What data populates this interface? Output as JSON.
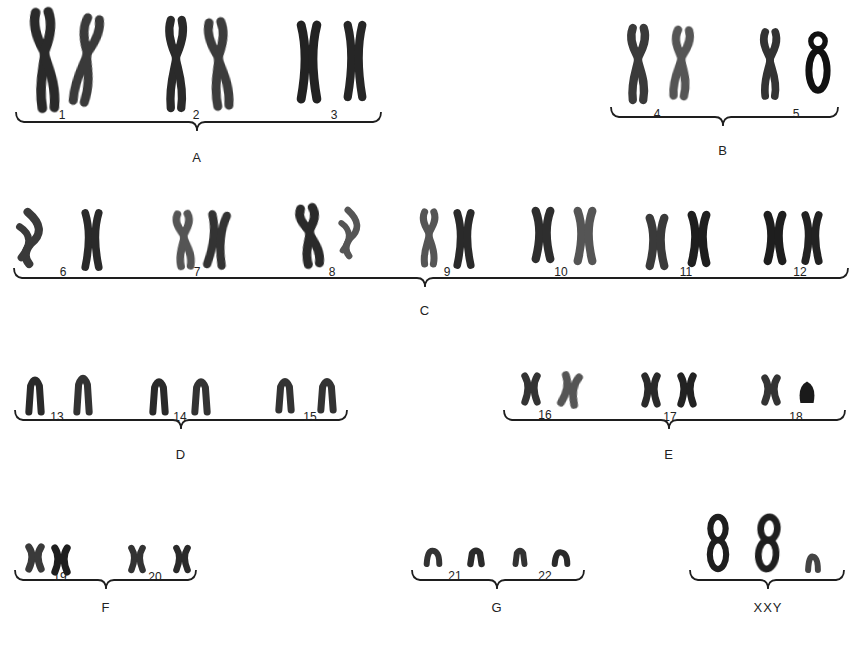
{
  "figure": {
    "ink_color": "#1e1e1e",
    "background": "#ffffff"
  },
  "groups": [
    {
      "label": "A",
      "label_x": 197,
      "label_y": 158,
      "brace": {
        "x1": 16,
        "x2": 381,
        "y": 122,
        "mid": 197
      },
      "numbers": [
        {
          "n": "1",
          "x": 62,
          "y": 116
        },
        {
          "n": "2",
          "x": 196,
          "y": 116
        },
        {
          "n": "3",
          "x": 334,
          "y": 116
        }
      ]
    },
    {
      "label": "B",
      "label_x": 723,
      "label_y": 151,
      "brace": {
        "x1": 611,
        "x2": 838,
        "y": 117,
        "mid": 723
      },
      "numbers": [
        {
          "n": "4",
          "x": 657,
          "y": 115
        },
        {
          "n": "5",
          "x": 796,
          "y": 115
        }
      ]
    },
    {
      "label": "C",
      "label_x": 425,
      "label_y": 311,
      "brace": {
        "x1": 14,
        "x2": 848,
        "y": 278,
        "mid": 425
      },
      "numbers": [
        {
          "n": "6",
          "x": 63,
          "y": 273
        },
        {
          "n": "7",
          "x": 197,
          "y": 273
        },
        {
          "n": "8",
          "x": 332,
          "y": 273
        },
        {
          "n": "9",
          "x": 447,
          "y": 273
        },
        {
          "n": "10",
          "x": 561,
          "y": 273
        },
        {
          "n": "11",
          "x": 686,
          "y": 273
        },
        {
          "n": "12",
          "x": 800,
          "y": 273
        }
      ]
    },
    {
      "label": "D",
      "label_x": 181,
      "label_y": 455,
      "brace": {
        "x1": 15,
        "x2": 347,
        "y": 420,
        "mid": 181
      },
      "numbers": [
        {
          "n": "13",
          "x": 57,
          "y": 418
        },
        {
          "n": "14",
          "x": 180,
          "y": 418
        },
        {
          "n": "15",
          "x": 310,
          "y": 418
        }
      ]
    },
    {
      "label": "E",
      "label_x": 669,
      "label_y": 455,
      "brace": {
        "x1": 504,
        "x2": 845,
        "y": 420,
        "mid": 669
      },
      "numbers": [
        {
          "n": "16",
          "x": 545,
          "y": 416
        },
        {
          "n": "17",
          "x": 670,
          "y": 418
        },
        {
          "n": "18",
          "x": 796,
          "y": 418
        }
      ]
    },
    {
      "label": "F",
      "label_x": 106,
      "label_y": 608,
      "brace": {
        "x1": 15,
        "x2": 196,
        "y": 580,
        "mid": 106
      },
      "numbers": [
        {
          "n": "19",
          "x": 60,
          "y": 578
        },
        {
          "n": "20",
          "x": 155,
          "y": 578
        }
      ]
    },
    {
      "label": "G",
      "label_x": 497,
      "label_y": 608,
      "brace": {
        "x1": 412,
        "x2": 584,
        "y": 580,
        "mid": 497
      },
      "numbers": [
        {
          "n": "21",
          "x": 455,
          "y": 577
        },
        {
          "n": "22",
          "x": 545,
          "y": 577
        }
      ]
    },
    {
      "label": "XXY",
      "label_x": 768,
      "label_y": 608,
      "brace": {
        "x1": 690,
        "x2": 844,
        "y": 580,
        "mid": 768
      },
      "numbers": []
    }
  ],
  "chromosomes": [
    {
      "id": "1a",
      "x": 30,
      "y": 10,
      "w": 30,
      "h": 100,
      "shape": "long",
      "shade": "#2a2a2a",
      "tilt": -4
    },
    {
      "id": "1b",
      "x": 72,
      "y": 16,
      "w": 28,
      "h": 88,
      "shape": "long",
      "shade": "#3a3a3a",
      "tilt": 10
    },
    {
      "id": "2a",
      "x": 163,
      "y": 18,
      "w": 26,
      "h": 92,
      "shape": "long",
      "shade": "#2a2a2a",
      "tilt": 0
    },
    {
      "id": "2b",
      "x": 205,
      "y": 20,
      "w": 28,
      "h": 88,
      "shape": "long",
      "shade": "#3c3c3c",
      "tilt": -6
    },
    {
      "id": "3a",
      "x": 295,
      "y": 22,
      "w": 28,
      "h": 80,
      "shape": "x",
      "shade": "#222222",
      "tilt": 0
    },
    {
      "id": "3b",
      "x": 342,
      "y": 22,
      "w": 26,
      "h": 78,
      "shape": "x",
      "shade": "#262626",
      "tilt": 0
    },
    {
      "id": "4a",
      "x": 625,
      "y": 26,
      "w": 26,
      "h": 76,
      "shape": "long",
      "shade": "#3a3a3a",
      "tilt": 0
    },
    {
      "id": "4b",
      "x": 668,
      "y": 28,
      "w": 26,
      "h": 70,
      "shape": "long",
      "shade": "#555555",
      "tilt": 4
    },
    {
      "id": "5a",
      "x": 758,
      "y": 30,
      "w": 24,
      "h": 68,
      "shape": "long",
      "shade": "#333333",
      "tilt": 0
    },
    {
      "id": "5b",
      "x": 806,
      "y": 32,
      "w": 24,
      "h": 62,
      "shape": "ring",
      "shade": "#111111",
      "tilt": 0
    },
    {
      "id": "6a",
      "x": 18,
      "y": 210,
      "w": 32,
      "h": 56,
      "shape": "bent",
      "shade": "#3a3a3a",
      "tilt": 0
    },
    {
      "id": "6b",
      "x": 80,
      "y": 210,
      "w": 24,
      "h": 60,
      "shape": "x",
      "shade": "#2a2a2a",
      "tilt": 0
    },
    {
      "id": "7a",
      "x": 172,
      "y": 212,
      "w": 24,
      "h": 56,
      "shape": "long",
      "shade": "#555555",
      "tilt": -4
    },
    {
      "id": "7b",
      "x": 204,
      "y": 212,
      "w": 26,
      "h": 56,
      "shape": "x",
      "shade": "#333333",
      "tilt": 6
    },
    {
      "id": "8a",
      "x": 296,
      "y": 206,
      "w": 28,
      "h": 60,
      "shape": "long",
      "shade": "#2a2a2a",
      "tilt": -8
    },
    {
      "id": "8b",
      "x": 340,
      "y": 208,
      "w": 26,
      "h": 50,
      "shape": "bent",
      "shade": "#555555",
      "tilt": 0
    },
    {
      "id": "9a",
      "x": 418,
      "y": 210,
      "w": 22,
      "h": 56,
      "shape": "long",
      "shade": "#555555",
      "tilt": 0
    },
    {
      "id": "9b",
      "x": 452,
      "y": 210,
      "w": 24,
      "h": 58,
      "shape": "x",
      "shade": "#2a2a2a",
      "tilt": 0
    },
    {
      "id": "10a",
      "x": 530,
      "y": 208,
      "w": 26,
      "h": 54,
      "shape": "x",
      "shade": "#2e2e2e",
      "tilt": 0
    },
    {
      "id": "10b",
      "x": 572,
      "y": 208,
      "w": 26,
      "h": 56,
      "shape": "x",
      "shade": "#555555",
      "tilt": 0
    },
    {
      "id": "11a",
      "x": 644,
      "y": 215,
      "w": 26,
      "h": 54,
      "shape": "x",
      "shade": "#3a3a3a",
      "tilt": 0
    },
    {
      "id": "11b",
      "x": 686,
      "y": 212,
      "w": 26,
      "h": 54,
      "shape": "x",
      "shade": "#1e1e1e",
      "tilt": 0
    },
    {
      "id": "12a",
      "x": 762,
      "y": 212,
      "w": 26,
      "h": 52,
      "shape": "x",
      "shade": "#1e1e1e",
      "tilt": 0
    },
    {
      "id": "12b",
      "x": 800,
      "y": 212,
      "w": 24,
      "h": 52,
      "shape": "x",
      "shade": "#222222",
      "tilt": 0
    },
    {
      "id": "13a",
      "x": 24,
      "y": 374,
      "w": 22,
      "h": 40,
      "shape": "arch",
      "shade": "#2a2a2a",
      "tilt": 0
    },
    {
      "id": "13b",
      "x": 72,
      "y": 372,
      "w": 22,
      "h": 42,
      "shape": "arch",
      "shade": "#333333",
      "tilt": 0
    },
    {
      "id": "14a",
      "x": 148,
      "y": 376,
      "w": 22,
      "h": 38,
      "shape": "arch",
      "shade": "#2a2a2a",
      "tilt": 0
    },
    {
      "id": "14b",
      "x": 190,
      "y": 376,
      "w": 22,
      "h": 38,
      "shape": "arch",
      "shade": "#333333",
      "tilt": 0
    },
    {
      "id": "15a",
      "x": 274,
      "y": 376,
      "w": 22,
      "h": 36,
      "shape": "arch",
      "shade": "#333333",
      "tilt": 0
    },
    {
      "id": "15b",
      "x": 316,
      "y": 376,
      "w": 22,
      "h": 36,
      "shape": "arch",
      "shade": "#333333",
      "tilt": 0
    },
    {
      "id": "16a",
      "x": 520,
      "y": 373,
      "w": 22,
      "h": 32,
      "shape": "x",
      "shade": "#333333",
      "tilt": 0
    },
    {
      "id": "16b",
      "x": 558,
      "y": 373,
      "w": 24,
      "h": 34,
      "shape": "x",
      "shade": "#555555",
      "tilt": 10
    },
    {
      "id": "17a",
      "x": 640,
      "y": 373,
      "w": 22,
      "h": 34,
      "shape": "x",
      "shade": "#2a2a2a",
      "tilt": 0
    },
    {
      "id": "17b",
      "x": 676,
      "y": 373,
      "w": 22,
      "h": 34,
      "shape": "x",
      "shade": "#222222",
      "tilt": 0
    },
    {
      "id": "18a",
      "x": 760,
      "y": 375,
      "w": 22,
      "h": 30,
      "shape": "x",
      "shade": "#333333",
      "tilt": 0
    },
    {
      "id": "18b",
      "x": 796,
      "y": 379,
      "w": 22,
      "h": 26,
      "shape": "blob",
      "shade": "#1a1a1a",
      "tilt": 0
    },
    {
      "id": "19a",
      "x": 24,
      "y": 544,
      "w": 22,
      "h": 28,
      "shape": "x",
      "shade": "#3a3a3a",
      "tilt": 0
    },
    {
      "id": "19b",
      "x": 50,
      "y": 545,
      "w": 22,
      "h": 30,
      "shape": "x",
      "shade": "#1e1e1e",
      "tilt": 0
    },
    {
      "id": "20a",
      "x": 127,
      "y": 545,
      "w": 20,
      "h": 28,
      "shape": "x",
      "shade": "#333333",
      "tilt": 0
    },
    {
      "id": "20b",
      "x": 172,
      "y": 545,
      "w": 20,
      "h": 28,
      "shape": "x",
      "shade": "#2a2a2a",
      "tilt": 0
    },
    {
      "id": "21a",
      "x": 424,
      "y": 548,
      "w": 18,
      "h": 18,
      "shape": "small",
      "shade": "#333333",
      "tilt": 0
    },
    {
      "id": "21b",
      "x": 466,
      "y": 548,
      "w": 20,
      "h": 18,
      "shape": "arch",
      "shade": "#2a2a2a",
      "tilt": 0
    },
    {
      "id": "22a",
      "x": 512,
      "y": 548,
      "w": 16,
      "h": 18,
      "shape": "arch",
      "shade": "#333333",
      "tilt": 0
    },
    {
      "id": "22b",
      "x": 552,
      "y": 550,
      "w": 18,
      "h": 16,
      "shape": "small",
      "shade": "#2a2a2a",
      "tilt": 0
    },
    {
      "id": "Xa",
      "x": 706,
      "y": 514,
      "w": 24,
      "h": 58,
      "shape": "eight",
      "shade": "#1e1e1e",
      "tilt": 0
    },
    {
      "id": "Xb",
      "x": 755,
      "y": 514,
      "w": 26,
      "h": 58,
      "shape": "eight",
      "shade": "#1e1e1e",
      "tilt": 4
    },
    {
      "id": "Y",
      "x": 806,
      "y": 554,
      "w": 14,
      "h": 18,
      "shape": "small",
      "shade": "#444444",
      "tilt": 0
    }
  ]
}
